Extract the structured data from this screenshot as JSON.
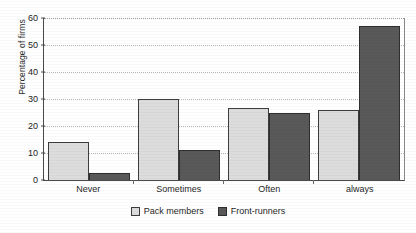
{
  "chart_data": {
    "type": "bar",
    "title": "",
    "xlabel": "",
    "ylabel": "Percentage of firms",
    "categories": [
      "Never",
      "Sometimes",
      "Often",
      "always"
    ],
    "series": [
      {
        "name": "Pack members",
        "color": "#dcdcdc",
        "values": [
          14,
          30,
          26.5,
          26
        ]
      },
      {
        "name": "Front-runners",
        "color": "#595959",
        "values": [
          2.5,
          11,
          25,
          57
        ]
      }
    ],
    "ylim": [
      0,
      60
    ],
    "yticks": [
      0,
      10,
      20,
      30,
      40,
      50,
      60
    ],
    "ytick_labels": [
      "0",
      "10",
      "20",
      "30",
      "40",
      "50",
      "60"
    ],
    "grid": true,
    "grid_style": "dotted-horizontal",
    "legend_position": "bottom-center"
  },
  "axis": {
    "y_title": "Percentage of firms",
    "ticks": [
      {
        "value": 60,
        "label": "60"
      },
      {
        "value": 50,
        "label": "50"
      },
      {
        "value": 40,
        "label": "40"
      },
      {
        "value": 30,
        "label": "30"
      },
      {
        "value": 20,
        "label": "20"
      },
      {
        "value": 10,
        "label": "10"
      },
      {
        "value": 0,
        "label": "0"
      }
    ]
  },
  "categories": [
    {
      "label": "Never",
      "light": 14,
      "dark": 2.5
    },
    {
      "label": "Sometimes",
      "light": 30,
      "dark": 11
    },
    {
      "label": "Often",
      "light": 26.5,
      "dark": 25
    },
    {
      "label": "always",
      "light": 26,
      "dark": 57
    }
  ],
  "legend": {
    "items": [
      {
        "label": "Pack members",
        "swatch": "light"
      },
      {
        "label": "Front-runners",
        "swatch": "dark"
      }
    ]
  }
}
